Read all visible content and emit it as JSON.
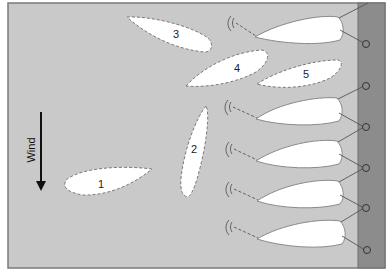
{
  "diagram": {
    "colors": {
      "water": "#c9c9c9",
      "frame_border": "#7a7a7a",
      "shore": "#8c8c8c",
      "shore_edge": "#6e6e6e",
      "hull_fill": "#ffffff",
      "hull_outline": "#8a8a8a",
      "dashed_outline": "#7a7a7a",
      "line": "#555555",
      "arrow": "#111111"
    },
    "wind": {
      "label": "Wind",
      "direction": "down"
    },
    "positions": [
      {
        "label": "1"
      },
      {
        "label": "2"
      },
      {
        "label": "3"
      },
      {
        "label": "4"
      },
      {
        "label": "5"
      }
    ],
    "moored_boats": [
      {
        "id": "boat-1"
      },
      {
        "id": "boat-2"
      },
      {
        "id": "boat-3"
      },
      {
        "id": "boat-4"
      },
      {
        "id": "boat-5"
      }
    ],
    "icons": {
      "anchor": "anchor-symbol",
      "bollard": "bollard-circle"
    }
  }
}
